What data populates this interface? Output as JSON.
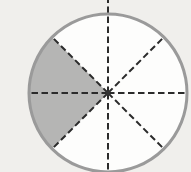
{
  "figure": {
    "type": "fraction-circle",
    "total_sectors": 8,
    "shaded_sectors_count": 2,
    "shaded_fraction": "2/8 (1/4)",
    "sector_angle_deg": 45,
    "ray_angles_deg": [
      0,
      45,
      90,
      135,
      180,
      225,
      270,
      315
    ],
    "shaded_sector_ranges_deg": [
      [
        135,
        180
      ],
      [
        180,
        225
      ]
    ],
    "geometry": {
      "canvas_w": 191,
      "canvas_h": 172,
      "cx": 108,
      "cy": 93,
      "r": 79,
      "outline_width": 3,
      "dash_width": 2,
      "dash_array": "6.5 3.5",
      "center_dot_r": 2.4,
      "up_ray_extends_to_top": true
    },
    "colors": {
      "background": "#f0efec",
      "circle_fill": "#fdfdfc",
      "circle_stroke": "#9a9a9a",
      "shaded_fill": "#b5b5b4",
      "dash_color": "#2b2b2b",
      "center_dot": "#333333"
    }
  }
}
